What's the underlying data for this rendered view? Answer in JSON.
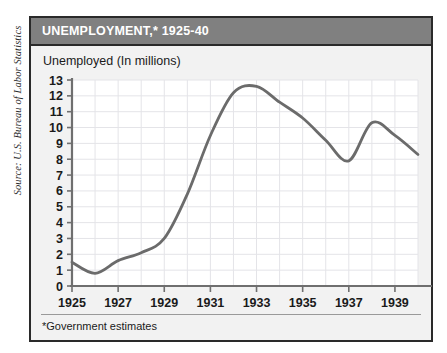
{
  "source_credit": "Source: U.S. Bureau of Labor Statistics",
  "panel": {
    "title": "UNEMPLOYMENT,* 1925-40",
    "subtitle": "Unemployed (In millions)",
    "footnote": "*Government estimates"
  },
  "colors": {
    "title_bar": "#808080",
    "title_text": "#ffffff",
    "border": "#2a2a2a",
    "panel_bg": "#f2f2f2",
    "plot_bg": "#ffffff",
    "grid": "#e4e4e8",
    "axis": "#6f6f6f",
    "line": "#6b6b6b",
    "text": "#1a1a1a"
  },
  "chart_data": {
    "type": "line",
    "title": "UNEMPLOYMENT,* 1925-40",
    "subtitle": "Unemployed (In millions)",
    "xlabel": "",
    "ylabel": "Unemployed (In millions)",
    "xlim": [
      1925,
      1940
    ],
    "ylim": [
      0,
      13
    ],
    "grid": true,
    "legend": "none",
    "note": "*Government estimates",
    "ytick_labels": [
      "0",
      "1",
      "2",
      "3",
      "4",
      "5",
      "6",
      "7",
      "8",
      "9",
      "10",
      "11",
      "12",
      "13"
    ],
    "ytick_values": [
      0,
      1,
      2,
      3,
      4,
      5,
      6,
      7,
      8,
      9,
      10,
      11,
      12,
      13
    ],
    "xtick_labels": [
      "1925",
      "1927",
      "1929",
      "1931",
      "1933",
      "1935",
      "1937",
      "1939"
    ],
    "xtick_values": [
      1925,
      1927,
      1929,
      1931,
      1933,
      1935,
      1937,
      1939
    ],
    "xminor_values": [
      1926,
      1928,
      1930,
      1932,
      1934,
      1936,
      1938,
      1940
    ],
    "series": [
      {
        "name": "Unemployed (millions)",
        "x": [
          1925,
          1926,
          1927,
          1928,
          1929,
          1930,
          1931,
          1932,
          1933,
          1934,
          1935,
          1936,
          1937,
          1938,
          1939,
          1940
        ],
        "values": [
          1.5,
          0.8,
          1.6,
          2.1,
          3.0,
          5.8,
          9.5,
          12.2,
          12.6,
          11.6,
          10.6,
          9.2,
          7.9,
          10.3,
          9.5,
          8.3
        ]
      }
    ]
  }
}
